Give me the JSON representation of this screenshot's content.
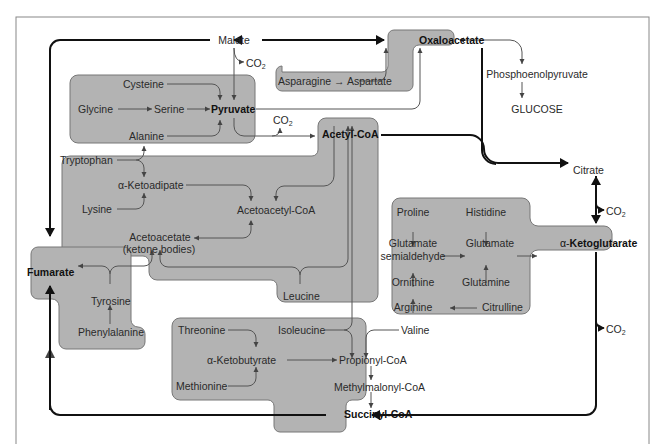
{
  "colors": {
    "box_fill": "#b3b3b3",
    "box_stroke": "#777777",
    "main_arrow": "#111111",
    "thin_arrow": "#555555",
    "frame": "#888888"
  },
  "tca": {
    "malate": "Malate",
    "oxaloacetate": "Oxaloacetate",
    "citrate": "Citrate",
    "alpha_ketoglutarate_prefix": "α-",
    "alpha_ketoglutarate": "Ketoglutarate",
    "succinyl_coa": "Succinyl-CoA",
    "fumarate": "Fumarate",
    "co2": "CO",
    "co2_sub": "2"
  },
  "gluconeogenesis": {
    "pep": "Phosphoenolpyruvate",
    "glucose": "GLUCOSE"
  },
  "pyruvate_group": {
    "cysteine": "Cysteine",
    "glycine": "Glycine",
    "serine": "Serine",
    "pyruvate": "Pyruvate",
    "alanine": "Alanine"
  },
  "oxaloacetate_group": {
    "asparagine": "Asparagine",
    "arrow": "→",
    "aspartate": "Aspartate"
  },
  "acetyl_group": {
    "acetyl_coa": "Acetyl-CoA",
    "tryptophan": "Tryptophan",
    "alpha_ketoadipate": "α-Ketoadipate",
    "lysine": "Lysine",
    "acetoacetyl_coa": "Acetoacetyl-CoA",
    "acetoacetate": "Acetoacetate",
    "ketone_bodies": "(ketone bodies)",
    "leucine": "Leucine"
  },
  "fumarate_group": {
    "tyrosine": "Tyrosine",
    "phenylalanine": "Phenylalanine"
  },
  "ketoglutarate_group": {
    "proline": "Proline",
    "histidine": "Histidine",
    "glutamate_semialdehyde_1": "Glutamate",
    "glutamate_semialdehyde_2": "semialdehyde",
    "glutamate": "Glutamate",
    "ornithine": "Ornithine",
    "glutamine": "Glutamine",
    "arginine": "Arginine",
    "citrulline": "Citrulline"
  },
  "succinyl_group": {
    "threonine": "Threonine",
    "isoleucine": "Isoleucine",
    "valine": "Valine",
    "alpha_ketobutyrate": "α-Ketobutyrate",
    "methionine": "Methionine",
    "propionyl_coa": "Propionyl-CoA",
    "methylmalonyl_coa": "Methylmalonyl-CoA"
  }
}
